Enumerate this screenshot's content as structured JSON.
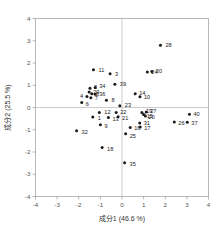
{
  "chart_data": {
    "type": "scatter",
    "title": "",
    "xlabel": "成分1 (46.6 %)",
    "ylabel": "成分2 (25.5 %)",
    "xlim": [
      -4,
      4
    ],
    "ylim": [
      -4,
      4
    ],
    "xticks": [
      "-4",
      "-3",
      "-2",
      "-1",
      "0",
      "1",
      "2",
      "3",
      "4"
    ],
    "yticks": [
      "-4",
      "-3",
      "-2",
      "-1",
      "0",
      "1",
      "2",
      "3",
      "4"
    ],
    "xtick_values": [
      -4,
      -3,
      -2,
      -1,
      0,
      1,
      2,
      3,
      4
    ],
    "ytick_values": [
      -4,
      -3,
      -2,
      -1,
      0,
      1,
      2,
      3,
      4
    ],
    "grid": false,
    "legend": false,
    "marker_color": "#1a1a1a",
    "marker_shape": "circle",
    "axis_color": "#9a9a9a",
    "zero_line_color": "#b8b8b8",
    "points": [
      {
        "label": "11",
        "x": -1.32,
        "y": 1.7,
        "lx": 5,
        "ly": 2
      },
      {
        "label": "3",
        "x": -0.55,
        "y": 1.52,
        "lx": 5,
        "ly": 2
      },
      {
        "label": "28",
        "x": 1.78,
        "y": 2.8,
        "lx": 5,
        "ly": 2
      },
      {
        "label": "24",
        "x": 1.17,
        "y": 1.6,
        "lx": 4,
        "ly": 2
      },
      {
        "label": "30",
        "x": 1.38,
        "y": 1.62,
        "lx": 4,
        "ly": 2
      },
      {
        "label": "39",
        "x": -0.33,
        "y": 1.05,
        "lx": 5,
        "ly": 2
      },
      {
        "label": "2",
        "x": -1.48,
        "y": 0.86,
        "lx": 4,
        "ly": 1
      },
      {
        "label": "34",
        "x": -1.24,
        "y": 0.9,
        "lx": 4,
        "ly": 1
      },
      {
        "label": "29",
        "x": -1.52,
        "y": 0.7,
        "lx": 4,
        "ly": 2
      },
      {
        "label": "5",
        "x": -1.4,
        "y": 0.62,
        "lx": 4,
        "ly": 2
      },
      {
        "label": "36",
        "x": -1.24,
        "y": 0.6,
        "lx": 4,
        "ly": 2
      },
      {
        "label": "4",
        "x": -1.62,
        "y": 0.5,
        "lx": -7,
        "ly": 2
      },
      {
        "label": "7",
        "x": -1.44,
        "y": 0.44,
        "lx": 4,
        "ly": 2
      },
      {
        "label": "6",
        "x": -1.86,
        "y": 0.22,
        "lx": 4,
        "ly": 3
      },
      {
        "label": "8",
        "x": -0.72,
        "y": 0.33,
        "lx": 5,
        "ly": 2
      },
      {
        "label": "14",
        "x": 0.61,
        "y": 0.62,
        "lx": 4,
        "ly": 1
      },
      {
        "label": "10",
        "x": 0.83,
        "y": 0.48,
        "lx": 4,
        "ly": 2
      },
      {
        "label": "23",
        "x": -0.1,
        "y": 0.08,
        "lx": 5,
        "ly": 1
      },
      {
        "label": "12",
        "x": -1.05,
        "y": -0.22,
        "lx": 5,
        "ly": 2
      },
      {
        "label": "22",
        "x": -0.27,
        "y": -0.22,
        "lx": 4,
        "ly": 2
      },
      {
        "label": "1",
        "x": -1.35,
        "y": -0.43,
        "lx": 5,
        "ly": 3
      },
      {
        "label": "13",
        "x": -0.63,
        "y": -0.45,
        "lx": 4,
        "ly": 3
      },
      {
        "label": "21",
        "x": -0.18,
        "y": -0.42,
        "lx": 4,
        "ly": 3
      },
      {
        "label": "19",
        "x": 0.92,
        "y": -0.22,
        "lx": 4,
        "ly": 1
      },
      {
        "label": "27",
        "x": 1.12,
        "y": -0.2,
        "lx": 4,
        "ly": 1
      },
      {
        "label": "15",
        "x": 1.0,
        "y": -0.32,
        "lx": 3,
        "ly": 3
      },
      {
        "label": "20",
        "x": 1.08,
        "y": -0.38,
        "lx": 3,
        "ly": 3
      },
      {
        "label": "40",
        "x": 3.12,
        "y": -0.3,
        "lx": 4,
        "ly": 2
      },
      {
        "label": "26",
        "x": 2.42,
        "y": -0.65,
        "lx": 4,
        "ly": 3
      },
      {
        "label": "37",
        "x": 3.02,
        "y": -0.66,
        "lx": 4,
        "ly": 3
      },
      {
        "label": "9",
        "x": -1.0,
        "y": -0.78,
        "lx": 4,
        "ly": 3
      },
      {
        "label": "31",
        "x": 0.82,
        "y": -0.7,
        "lx": 4,
        "ly": 2
      },
      {
        "label": "17",
        "x": 0.84,
        "y": -0.88,
        "lx": 4,
        "ly": 3
      },
      {
        "label": "16",
        "x": 0.38,
        "y": -0.9,
        "lx": 4,
        "ly": 2
      },
      {
        "label": "32",
        "x": -2.1,
        "y": -1.04,
        "lx": 5,
        "ly": 3
      },
      {
        "label": "25",
        "x": 0.17,
        "y": -1.18,
        "lx": 4,
        "ly": 4
      },
      {
        "label": "18",
        "x": -0.92,
        "y": -1.8,
        "lx": 5,
        "ly": 3
      },
      {
        "label": "35",
        "x": 0.12,
        "y": -2.48,
        "lx": 5,
        "ly": 3
      }
    ]
  }
}
